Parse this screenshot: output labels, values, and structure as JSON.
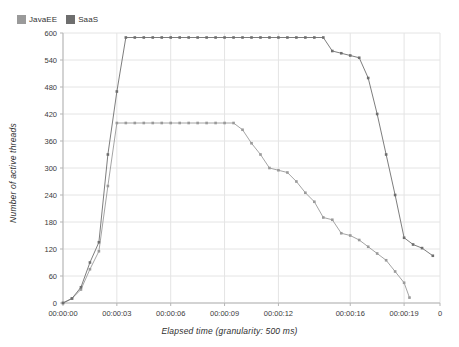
{
  "chart_data": {
    "type": "line",
    "title": "",
    "xlabel": "Elapsed time (granularity: 500 ms)",
    "ylabel": "Number of active threads",
    "grid": true,
    "legend_position": "top-left",
    "xlim": [
      0,
      21.0
    ],
    "ylim": [
      0,
      600
    ],
    "y_ticks": [
      0,
      60,
      120,
      180,
      240,
      300,
      360,
      420,
      480,
      540,
      600
    ],
    "y_tick_labels": [
      "0",
      "60",
      "120",
      "180",
      "240",
      "300",
      "360",
      "420",
      "480",
      "540",
      "600"
    ],
    "x_ticks": [
      0,
      3,
      6,
      9,
      12,
      16,
      19,
      21
    ],
    "x_tick_labels": [
      "00:00:00",
      "00:00:03",
      "00:00:06",
      "00:00:09",
      "00:00:12",
      "00:00:16",
      "00:00:19",
      "0"
    ],
    "series": [
      {
        "name": "JavaEE",
        "color": "#9a9a9a",
        "marker": "square",
        "x": [
          0.0,
          0.5,
          1.0,
          1.5,
          2.0,
          2.5,
          3.0,
          3.5,
          4.0,
          4.5,
          5.0,
          5.5,
          6.0,
          6.5,
          7.0,
          7.5,
          8.0,
          8.5,
          9.0,
          9.5,
          10.0,
          10.5,
          11.0,
          11.5,
          12.0,
          12.5,
          13.0,
          13.5,
          14.0,
          14.5,
          15.0,
          15.5,
          16.0,
          16.5,
          17.0,
          17.5,
          18.0,
          18.5,
          19.0,
          19.3
        ],
        "y": [
          0,
          10,
          30,
          75,
          115,
          260,
          400,
          400,
          400,
          400,
          400,
          400,
          400,
          400,
          400,
          400,
          400,
          400,
          400,
          400,
          385,
          355,
          330,
          300,
          295,
          290,
          270,
          245,
          225,
          190,
          185,
          155,
          150,
          140,
          125,
          110,
          95,
          70,
          45,
          12
        ]
      },
      {
        "name": "SaaS",
        "color": "#6e6e6e",
        "marker": "square",
        "x": [
          0.0,
          0.5,
          1.0,
          1.5,
          2.0,
          2.5,
          3.0,
          3.5,
          4.0,
          4.5,
          5.0,
          5.5,
          6.0,
          6.5,
          7.0,
          7.5,
          8.0,
          8.5,
          9.0,
          9.5,
          10.0,
          10.5,
          11.0,
          11.5,
          12.0,
          12.5,
          13.0,
          13.5,
          14.0,
          14.5,
          15.0,
          15.5,
          16.0,
          16.5,
          17.0,
          17.5,
          18.0,
          18.5,
          19.0,
          19.5,
          20.0,
          20.6
        ],
        "y": [
          0,
          10,
          35,
          90,
          135,
          330,
          470,
          590,
          590,
          590,
          590,
          590,
          590,
          590,
          590,
          590,
          590,
          590,
          590,
          590,
          590,
          590,
          590,
          590,
          590,
          590,
          590,
          590,
          590,
          590,
          560,
          555,
          550,
          545,
          500,
          420,
          330,
          240,
          145,
          130,
          122,
          105
        ]
      }
    ]
  },
  "legend": {
    "entries": [
      {
        "label": "JavaEE",
        "color": "#9a9a9a"
      },
      {
        "label": "SaaS",
        "color": "#6e6e6e"
      }
    ]
  },
  "colors": {
    "background": "#ffffff",
    "grid": "#e4e4e4",
    "axis": "#b5b5b5",
    "text": "#3a3a3a",
    "javaee": "#9a9a9a",
    "saas": "#6e6e6e"
  }
}
